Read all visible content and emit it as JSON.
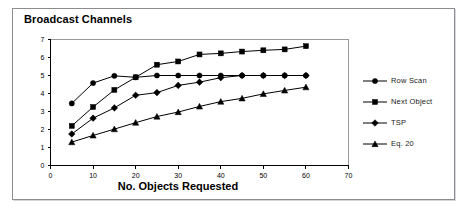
{
  "figure": {
    "title": "Broadcast Channels",
    "background_color": "#ffffff",
    "frame_color": "#8b8b90",
    "ink_color": "#000000"
  },
  "chart_data": {
    "type": "line",
    "title": "Broadcast Channels",
    "xlabel": "No. Objects Requested",
    "ylabel": "",
    "xlim": [
      0,
      70
    ],
    "ylim": [
      0,
      7
    ],
    "xticks": [
      0,
      10,
      20,
      30,
      40,
      50,
      60,
      70
    ],
    "yticks": [
      0,
      1,
      2,
      3,
      4,
      5,
      6,
      7
    ],
    "grid": false,
    "legend_position": "right",
    "x": [
      5,
      10,
      15,
      20,
      25,
      30,
      35,
      40,
      45,
      50,
      55,
      60
    ],
    "series": [
      {
        "name": "Row Scan",
        "marker": "circle",
        "values": [
          3.45,
          4.58,
          4.98,
          4.9,
          5.0,
          5.0,
          5.0,
          5.0,
          5.0,
          5.0,
          5.0,
          5.0
        ]
      },
      {
        "name": "Next Object",
        "marker": "square",
        "values": [
          2.2,
          3.25,
          4.2,
          4.9,
          5.6,
          5.78,
          6.17,
          6.23,
          6.33,
          6.4,
          6.45,
          6.63
        ]
      },
      {
        "name": "TSP",
        "marker": "diamond",
        "values": [
          1.75,
          2.63,
          3.2,
          3.9,
          4.05,
          4.45,
          4.63,
          4.88,
          5.0,
          5.0,
          5.0,
          5.0
        ]
      },
      {
        "name": "Eq. 20",
        "marker": "triangle",
        "values": [
          1.3,
          1.67,
          2.02,
          2.38,
          2.72,
          2.97,
          3.28,
          3.55,
          3.73,
          3.98,
          4.17,
          4.35
        ]
      }
    ]
  },
  "legend": {
    "items": [
      {
        "label": "Row Scan",
        "marker": "circle"
      },
      {
        "label": "Next Object",
        "marker": "square"
      },
      {
        "label": "TSP",
        "marker": "diamond"
      },
      {
        "label": "Eq. 20",
        "marker": "triangle"
      }
    ]
  }
}
